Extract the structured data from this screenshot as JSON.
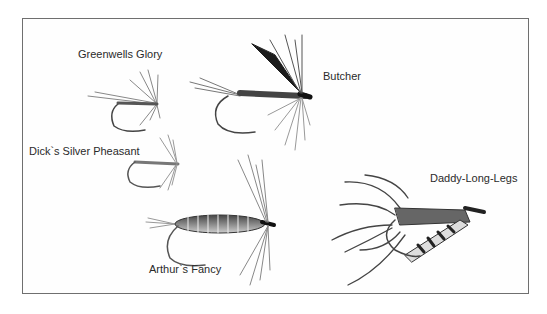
{
  "illustration": {
    "style": "grayscale pen-and-wash",
    "border_color": "#6f6f6f",
    "flies": [
      {
        "name": "Greenwells Glory"
      },
      {
        "name": "Butcher"
      },
      {
        "name": "Dick's Silver Pheasant"
      },
      {
        "name": "Arthur's Fancy"
      },
      {
        "name": "Daddy-Long-Legs"
      }
    ]
  },
  "labels": {
    "greenwells": "Greenwells Glory",
    "butcher": "Butcher",
    "dicks": "Dick`s Silver Pheasant",
    "arthurs": "Arthur`s Fancy",
    "daddy": "Daddy-Long-Legs"
  }
}
